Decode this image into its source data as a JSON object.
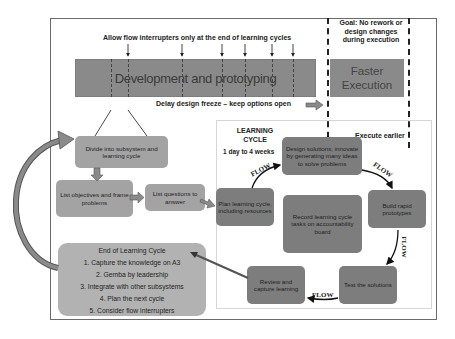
{
  "top_annotation": "Allow flow interrupters only at the end of learning cycles",
  "goal_annotation": [
    "Goal: No rework or",
    "design changes",
    "during execution"
  ],
  "development_bar": {
    "label": "Development and prototyping"
  },
  "execution_bar": {
    "label_line1": "Faster",
    "label_line2": "Execution"
  },
  "delay_annotation": "Delay design freeze – keep options open",
  "execute_earlier": "Execute earlier",
  "learning_cycle": {
    "title_line1": "LEARNING",
    "title_line2": "CYCLE",
    "duration": "1 day to 4 weeks",
    "steps": {
      "plan": "Plan learning cycle, including resources",
      "design": "Design solutions, innovate by generating many ideas to solve problems",
      "build": "Build rapid prototypes",
      "test": "Test the solutions",
      "review": "Review and capture learning",
      "record": "Record learning cycle tasks on accountability board"
    },
    "flow_labels": [
      "FLOW",
      "FLOW",
      "FLOW",
      "FLOW"
    ]
  },
  "planning_steps": {
    "divide": "Divide into subsystem  and learning cycle",
    "objectives": "List  objectives  and frame problems",
    "questions": "List questions to answer"
  },
  "end_of_cycle": {
    "title": "End of Learning Cycle",
    "items": [
      "1.   Capture the knowledge on A3",
      "2.   Gemba by leadership",
      "3.   Integrate with other subsystems",
      "4.   Plan the next cycle",
      "5.   Consider flow interrupters"
    ]
  },
  "colors": {
    "dark_box": "#7d7d7d",
    "medium_box": "#a3a3a3",
    "light_box": "#b2b2b2",
    "bar": "#8a8a8a"
  },
  "icons": {
    "interrupter_arrows": "down-arrow-icon",
    "feedback_arrow": "curved-arrow-icon",
    "block_arrows": "block-arrow-icon"
  }
}
